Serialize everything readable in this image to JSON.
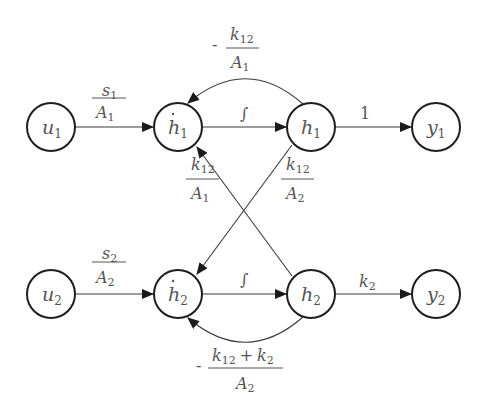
{
  "diagram": {
    "nodes": [
      {
        "id": "u1",
        "main": "u",
        "sub": "1",
        "dot": false
      },
      {
        "id": "h1dot",
        "main": "h",
        "sub": "1",
        "dot": true
      },
      {
        "id": "h1",
        "main": "h",
        "sub": "1",
        "dot": false
      },
      {
        "id": "y1",
        "main": "y",
        "sub": "1",
        "dot": false
      },
      {
        "id": "u2",
        "main": "u",
        "sub": "2",
        "dot": false
      },
      {
        "id": "h2dot",
        "main": "h",
        "sub": "2",
        "dot": true
      },
      {
        "id": "h2",
        "main": "h",
        "sub": "2",
        "dot": false
      },
      {
        "id": "y2",
        "main": "y",
        "sub": "2",
        "dot": false
      }
    ],
    "edges": [
      {
        "from": "u1",
        "to": "h1dot",
        "label": "s1/A1"
      },
      {
        "from": "h1dot",
        "to": "h1",
        "label": "∫"
      },
      {
        "from": "h1",
        "to": "y1",
        "label": "1"
      },
      {
        "from": "h1",
        "to": "h1dot",
        "label": "-k12/A1"
      },
      {
        "from": "h2",
        "to": "h1dot",
        "label": "k12/A1"
      },
      {
        "from": "h1",
        "to": "h2dot",
        "label": "k12/A2"
      },
      {
        "from": "u2",
        "to": "h2dot",
        "label": "s2/A2"
      },
      {
        "from": "h2dot",
        "to": "h2",
        "label": "∫"
      },
      {
        "from": "h2",
        "to": "y2",
        "label": "k2"
      },
      {
        "from": "h2",
        "to": "h2dot",
        "label": "-(k12+k2)/A2"
      }
    ],
    "labels": {
      "s1_num": "s",
      "s1_num_sub": "1",
      "s1_den": "A",
      "s1_den_sub": "1",
      "s2_num": "s",
      "s2_num_sub": "2",
      "s2_den": "A",
      "s2_den_sub": "2",
      "integral": "∫",
      "one": "1",
      "k2": "k",
      "k2_sub": "2",
      "fb1_sign": "-",
      "fb1_num": "k",
      "fb1_num_sub": "12",
      "fb1_den": "A",
      "fb1_den_sub": "1",
      "c21_num": "k",
      "c21_num_sub": "12",
      "c21_den": "A",
      "c21_den_sub": "1",
      "c12_num": "k",
      "c12_num_sub": "12",
      "c12_den": "A",
      "c12_den_sub": "2",
      "fb2_sign": "-",
      "fb2_num_a": "k",
      "fb2_num_a_sub": "12",
      "fb2_plus": "+",
      "fb2_num_b": "k",
      "fb2_num_b_sub": "2",
      "fb2_den": "A",
      "fb2_den_sub": "2"
    }
  }
}
